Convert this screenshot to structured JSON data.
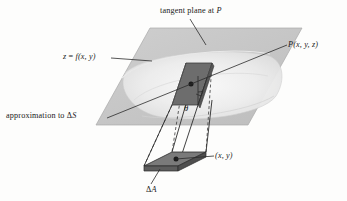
{
  "figure": {
    "type": "3d-geometry-diagram",
    "background": "#fdfdfc",
    "labels": {
      "tangent_plane": "tangent plane at P",
      "tangent_plane_plain": "tangent plane at ",
      "tangent_plane_var": "P",
      "surface_eq_lhs": "z",
      "surface_eq_rel": " = ",
      "surface_eq_fn": "f",
      "surface_eq_args": "(x, y)",
      "approximation_text": "approximation to ",
      "approximation_delta": "Δ",
      "approximation_var": "S",
      "point_label_var": "P",
      "point_label_args": "(x, y, z)",
      "base_point": "(x, y)",
      "area_delta": "Δ",
      "area_var": "A",
      "theta": "θ"
    },
    "colors": {
      "tangent_plane_fill": "#c9c9c9",
      "tangent_plane_stroke": "#9a9a9a",
      "surface_patch_fill": "#efefef",
      "surface_shadow": "#d6d6d6",
      "delta_s_fill": "#6d6d6d",
      "delta_s_side_fill": "#585858",
      "delta_a_fill": "#777777",
      "delta_a_side_fill": "#5d5d5d",
      "line_stroke": "#2b2b2b",
      "dash_stroke": "#3a3a3a",
      "prism_stroke": "#2b2b2b",
      "text_color": "#1b1b1b",
      "page_background": "#fdfdfc"
    },
    "elements": {
      "tangent_plane_name": "tangent plane parallelogram",
      "surface_name": "surface z = f(x,y)",
      "delta_s_name": "shaded surface element delta S",
      "delta_a_name": "shaded base area element delta A",
      "prism_name": "vertical prism connecting delta A to delta S",
      "point_p_name": "point P on surface",
      "point_xy_name": "point (x, y) in the xy-plane",
      "angle_name": "angle theta between normal and vertical",
      "right_angle_name": "right angle marker"
    },
    "geometry": {
      "tangent_plane_points": "92,96 148,38 300,38 244,96",
      "delta_s_points": "172,105 186,63 212,63 198,105",
      "delta_a_points": "144,166 172,152 206,152 178,166"
    }
  }
}
